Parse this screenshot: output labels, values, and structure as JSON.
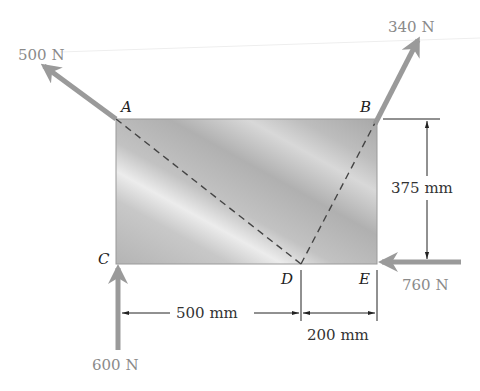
{
  "diagram": {
    "type": "free-body diagram",
    "points": {
      "A": {
        "label": "A"
      },
      "B": {
        "label": "B"
      },
      "C": {
        "label": "C"
      },
      "D": {
        "label": "D"
      },
      "E": {
        "label": "E"
      }
    },
    "forces": [
      {
        "id": "force_A",
        "label": "500 N",
        "at": "A",
        "direction": "up-left, along line DA"
      },
      {
        "id": "force_B",
        "label": "340 N",
        "at": "B",
        "direction": "up-right, along line DB"
      },
      {
        "id": "force_C",
        "label": "600 N",
        "at": "C",
        "direction": "up"
      },
      {
        "id": "force_E",
        "label": "760 N",
        "at": "E",
        "direction": "left"
      }
    ],
    "dimensions": {
      "height": "375 mm",
      "CD": "500 mm",
      "DE": "200 mm"
    },
    "colors": {
      "force_arrow": "#9a9a9a",
      "plate_light": "#e6e6e6",
      "plate_dark": "#a9a9a9",
      "dashed_line": "#444444",
      "dimension_line": "#222222"
    }
  }
}
